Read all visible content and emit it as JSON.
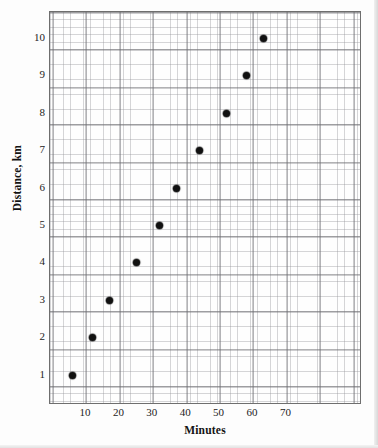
{
  "chart_data": {
    "type": "scatter",
    "title": "",
    "xlabel": "Minutes",
    "ylabel": "Distance, km",
    "xlim": [
      0,
      80
    ],
    "ylim": [
      0,
      10.5
    ],
    "grid": true,
    "legend": null,
    "xticks": [
      10,
      20,
      30,
      40,
      50,
      60,
      70
    ],
    "yticks": [
      1,
      2,
      3,
      4,
      5,
      6,
      7,
      8,
      9,
      10
    ],
    "xtick_labels": [
      "10",
      "20",
      "30",
      "40",
      "50",
      "60",
      "70"
    ],
    "ytick_labels": [
      "1",
      "2",
      "3",
      "4",
      "5",
      "6",
      "7",
      "8",
      "9",
      "10"
    ],
    "marker": "filled-circle",
    "marker_color": "#111111",
    "points": [
      {
        "x": 6,
        "y": 1
      },
      {
        "x": 12,
        "y": 2
      },
      {
        "x": 17,
        "y": 3
      },
      {
        "x": 25,
        "y": 4
      },
      {
        "x": 32,
        "y": 5
      },
      {
        "x": 37,
        "y": 6
      },
      {
        "x": 44,
        "y": 7
      },
      {
        "x": 52,
        "y": 8
      },
      {
        "x": 58,
        "y": 9
      },
      {
        "x": 63,
        "y": 10
      }
    ],
    "x_values": [
      6,
      12,
      17,
      25,
      32,
      37,
      44,
      52,
      58,
      63
    ],
    "y_values": [
      1,
      2,
      3,
      4,
      5,
      6,
      7,
      8,
      9,
      10
    ]
  },
  "colors": {
    "marker": "#111111",
    "frame": "#6e6e6e",
    "grid_major": "#46464c",
    "grid_minor": "#787880",
    "text": "#232323",
    "background": "#fdfdfd"
  }
}
